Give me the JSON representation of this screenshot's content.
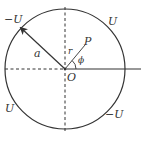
{
  "figure": {
    "colors": {
      "stroke": "#333333",
      "background": "#ffffff"
    },
    "labels": {
      "upper_left_quadrant": "−U",
      "upper_right_quadrant": "U",
      "lower_left_quadrant": "U",
      "lower_right_quadrant": "−U",
      "radius": "a",
      "origin": "O",
      "point": "P",
      "distance": "r",
      "angle": "ϕ"
    }
  }
}
